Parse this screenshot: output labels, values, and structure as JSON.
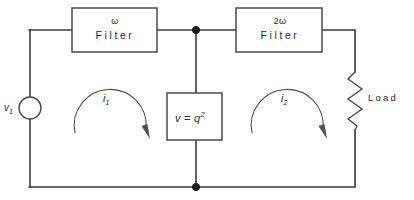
{
  "diagram": {
    "canvas": {
      "width": 414,
      "height": 200
    },
    "colors": {
      "background": "#ffffff",
      "wire": "#3a3a3a",
      "component_outline": "#4a4a4a",
      "node": "#1a1a1a",
      "arrow": "#55504e",
      "text": "#2b2b2b"
    }
  },
  "components": {
    "source": {
      "type": "voltage-source",
      "label": "v",
      "subscript": "1"
    },
    "filter_one": {
      "type": "filter-block",
      "frequency": "ω",
      "name": "Filter"
    },
    "filter_two": {
      "type": "filter-block",
      "frequency": "2ω",
      "name": "Filter"
    },
    "nonlinear_element": {
      "type": "block",
      "relation_lhs": "v",
      "relation_op": "=",
      "relation_rhs": "q",
      "relation_exponent": "2"
    },
    "load": {
      "type": "resistor",
      "label": "Load"
    }
  },
  "mesh_currents": [
    {
      "label": "i",
      "subscript": "1",
      "direction": "clockwise"
    },
    {
      "label": "i",
      "subscript": "2",
      "direction": "clockwise"
    }
  ],
  "nodes": [
    {
      "name": "top-center-node"
    },
    {
      "name": "bottom-center-node"
    }
  ]
}
